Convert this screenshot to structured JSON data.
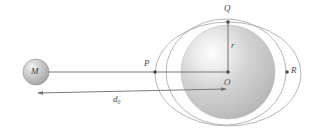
{
  "figure": {
    "background_color": "#ffffff",
    "line_color": "#6e6e6e",
    "label_color": "#4a4a4a",
    "sphere_fill_light": "#fbfbfb",
    "sphere_fill_mid": "#c8c8c8",
    "sphere_fill_dark": "#b0b0b0",
    "small_sphere_fill": "#c0c0c0"
  },
  "labels": {
    "point_Q": "Q",
    "radius_r": "r",
    "center_O": "O",
    "point_R": "R",
    "point_P": "P",
    "mass_M": "M",
    "distance_d0": "d",
    "distance_d0_subscript": "0"
  },
  "geometry": {
    "small_sphere": {
      "cx": 36,
      "cy": 72,
      "r": 13
    },
    "large_sphere": {
      "cx": 228,
      "cy": 72,
      "r": 47
    },
    "inner_ellipse": {
      "cx": 228,
      "cy": 74,
      "rx": 73,
      "ry": 52
    },
    "outer_ellipse": {
      "cx": 228,
      "cy": 72,
      "rx": 60,
      "ry": 53
    },
    "point_P": {
      "x": 155,
      "y": 72
    },
    "point_Q": {
      "x": 228,
      "y": 22
    },
    "point_O": {
      "x": 228,
      "y": 72
    },
    "point_R": {
      "x": 287,
      "y": 72
    },
    "line_M_to_O": {
      "x1": 47,
      "y1": 72,
      "x2": 228,
      "y2": 72
    },
    "line_r": {
      "x1": 228,
      "y1": 72,
      "x2": 228,
      "y2": 22
    },
    "arrow_d0": {
      "x1": 36,
      "y1": 93,
      "x2": 228,
      "y2": 89
    }
  }
}
